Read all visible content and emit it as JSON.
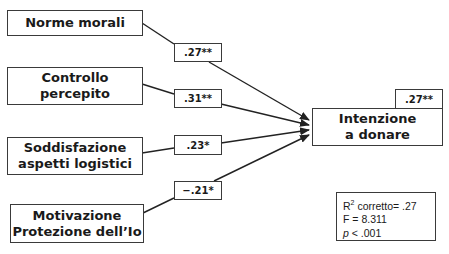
{
  "predictors": [
    {
      "label_lines": [
        "Norme morali"
      ],
      "coefficient": ".27**"
    },
    {
      "label_lines": [
        "Controllo",
        "percepito"
      ],
      "coefficient": ".31**"
    },
    {
      "label_lines": [
        "Soddisfazione",
        "aspetti logistici"
      ],
      "coefficient": ".23*"
    },
    {
      "label_lines": [
        "Motivazione",
        "Protezione dell’Io"
      ],
      "coefficient": "−.21*"
    }
  ],
  "outcome": {
    "label_lines": [
      "Intenzione",
      "a donare"
    ],
    "r2_badge": ".27**"
  },
  "stats": {
    "r2_prefix": "R",
    "r2_sup": "2",
    "r2_text": " corretto= .27",
    "f_text": "F = 8.311",
    "p_symbol": "p",
    "p_text": " < .001"
  }
}
